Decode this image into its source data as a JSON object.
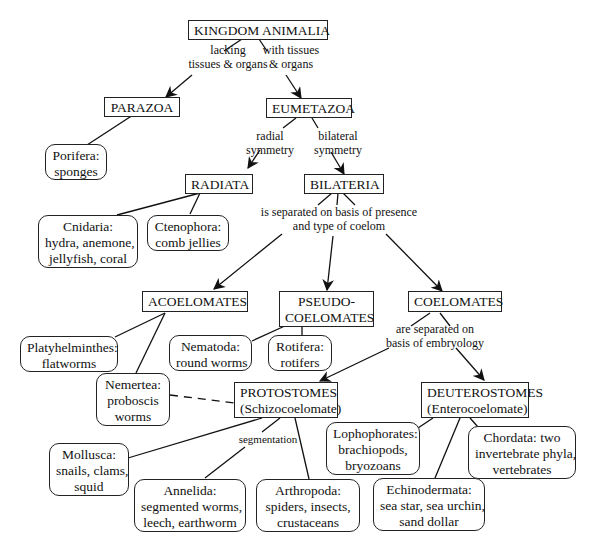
{
  "diagram": {
    "nodes": {
      "kingdom": {
        "lines": [
          "KINGDOM ANIMALIA"
        ]
      },
      "parazoa": {
        "lines": [
          "PARAZOA"
        ]
      },
      "eumetazoa": {
        "lines": [
          "EUMETAZOA"
        ]
      },
      "porifera": {
        "lines": [
          "Porifera:",
          "sponges"
        ]
      },
      "radiata": {
        "lines": [
          "RADIATA"
        ]
      },
      "bilateria": {
        "lines": [
          "BILATERIA"
        ]
      },
      "cnidaria": {
        "lines": [
          "Cnidaria:",
          "hydra, anemone,",
          "jellyfish, coral"
        ]
      },
      "ctenophora": {
        "lines": [
          "Ctenophora:",
          "comb jellies"
        ]
      },
      "acoelomates": {
        "lines": [
          "ACOELOMATES"
        ]
      },
      "pseudocoelomates": {
        "lines": [
          "PSEUDO-",
          "COELOMATES"
        ]
      },
      "coelomates": {
        "lines": [
          "COELOMATES"
        ]
      },
      "platyhelminthes": {
        "lines": [
          "Platyhelminthes:",
          "flatworms"
        ]
      },
      "nematoda": {
        "lines": [
          "Nematoda:",
          "round worms"
        ]
      },
      "rotifera": {
        "lines": [
          "Rotifera:",
          "rotifers"
        ]
      },
      "nemertea": {
        "lines": [
          "Nemertea:",
          "proboscis",
          "worms"
        ]
      },
      "protostomes": {
        "lines": [
          "PROTOSTOMES",
          "(Schizocoelomate)"
        ]
      },
      "deuterostomes": {
        "lines": [
          "DEUTEROSTOMES",
          "(Enterocoelomate)"
        ]
      },
      "mollusca": {
        "lines": [
          "Mollusca:",
          "snails, clams,",
          "squid"
        ]
      },
      "annelida": {
        "lines": [
          "Annelida:",
          "segmented worms,",
          "leech, earthworm"
        ]
      },
      "arthropoda": {
        "lines": [
          "Arthropoda:",
          "spiders, insects,",
          "crustaceans"
        ]
      },
      "lophophorates": {
        "lines": [
          "Lophophorates:",
          "brachiopods,",
          "bryozoans"
        ]
      },
      "chordata": {
        "lines": [
          "Chordata: two",
          "invertebrate phyla,",
          "vertebrates"
        ]
      },
      "echinodermata": {
        "lines": [
          "Echinodermata:",
          "sea star, sea urchin,",
          "sand dollar"
        ]
      }
    },
    "edge_labels": {
      "lacking": {
        "lines": [
          "lacking",
          "tissues & organs"
        ]
      },
      "with_tissues": {
        "lines": [
          "with tissues",
          "& organs"
        ]
      },
      "radial": {
        "lines": [
          "radial",
          "symmetry"
        ]
      },
      "bilateral": {
        "lines": [
          "bilateral",
          "symmetry"
        ]
      },
      "coelom": {
        "lines": [
          "is separated on basis of presence",
          "and type of coelom"
        ]
      },
      "embryology": {
        "lines": [
          "are separated on",
          "basis of embryology"
        ]
      },
      "segmentation": {
        "lines": [
          "segmentation"
        ]
      }
    }
  }
}
